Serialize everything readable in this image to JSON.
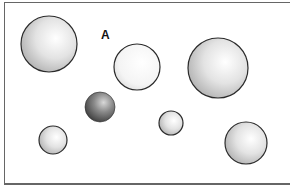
{
  "diagram": {
    "label": "A",
    "spheres": [
      {
        "id": "sphere-1",
        "cx": 49,
        "cy": 44,
        "r": 28,
        "shade": "light"
      },
      {
        "id": "sphere-2",
        "cx": 137,
        "cy": 67,
        "r": 23,
        "shade": "white"
      },
      {
        "id": "sphere-3",
        "cx": 218,
        "cy": 68,
        "r": 30,
        "shade": "light"
      },
      {
        "id": "sphere-4",
        "cx": 100,
        "cy": 107,
        "r": 15,
        "shade": "dark"
      },
      {
        "id": "sphere-5",
        "cx": 53,
        "cy": 140,
        "r": 14,
        "shade": "light"
      },
      {
        "id": "sphere-6",
        "cx": 171,
        "cy": 123,
        "r": 12,
        "shade": "light"
      },
      {
        "id": "sphere-7",
        "cx": 246,
        "cy": 143,
        "r": 21,
        "shade": "light"
      }
    ]
  }
}
